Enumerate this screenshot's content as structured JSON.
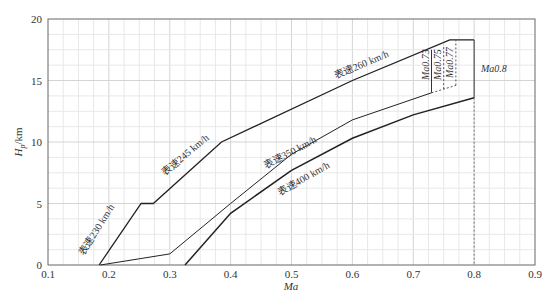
{
  "chart_data": {
    "type": "line",
    "title": "",
    "xlabel": "Ma",
    "ylabel": "H_p/km",
    "xlim": [
      0.1,
      0.9
    ],
    "ylim": [
      0,
      20
    ],
    "x_ticks": [
      "0.1",
      "0.2",
      "0.3",
      "0.4",
      "0.5",
      "0.6",
      "0.7",
      "0.8",
      "0.9"
    ],
    "y_ticks": [
      "0",
      "5",
      "10",
      "15",
      "20"
    ],
    "grid": true,
    "legend": "none (inline labels)",
    "series": [
      {
        "name": "upper envelope (表速230 / 245 / 260 km/h)",
        "points": [
          [
            0.184,
            0
          ],
          [
            0.253,
            5.0
          ],
          [
            0.273,
            5.0
          ],
          [
            0.385,
            10.0
          ],
          [
            0.6,
            15.0
          ],
          [
            0.76,
            18.3
          ],
          [
            0.8,
            18.3
          ]
        ]
      },
      {
        "name": "表速350 km/h",
        "points": [
          [
            0.186,
            0
          ],
          [
            0.3,
            0.9
          ],
          [
            0.4,
            5.0
          ],
          [
            0.5,
            9.0
          ],
          [
            0.6,
            11.8
          ],
          [
            0.73,
            14.0
          ]
        ]
      },
      {
        "name": "表速400 km/h",
        "points": [
          [
            0.325,
            0
          ],
          [
            0.4,
            4.2
          ],
          [
            0.5,
            7.7
          ],
          [
            0.6,
            10.3
          ],
          [
            0.7,
            12.2
          ],
          [
            0.8,
            13.6
          ]
        ]
      }
    ],
    "mach_limits": [
      {
        "label": "Ma0.73",
        "x": 0.73,
        "y_from": 14.0,
        "y_to": 17.5,
        "style": "solid"
      },
      {
        "label": "Ma0.75",
        "x": 0.75,
        "y_from": 14.3,
        "y_to": 17.9,
        "style": "dashed"
      },
      {
        "label": "Ma0.77",
        "x": 0.77,
        "y_from": 14.6,
        "y_to": 18.3,
        "style": "dashed"
      },
      {
        "label": "Ma0.8",
        "x": 0.8,
        "y_from": 13.6,
        "y_to": 18.3,
        "style": "solid"
      }
    ],
    "annotations": [
      "表速230 km/h",
      "表速245 km/h",
      "表速260 km/h",
      "表速350 km/h",
      "表速400 km/h",
      "Ma0.73",
      "Ma0.75",
      "Ma0.77",
      "Ma0.8"
    ]
  },
  "labels": {
    "s230": "表速230 km/h",
    "s245": "表速245 km/h",
    "s260": "表速260 km/h",
    "s350": "表速350 km/h",
    "s400": "表速400 km/h",
    "m073": "Ma0.73",
    "m075": "Ma0.75",
    "m077": "Ma0.77",
    "m08": "Ma0.8",
    "xlabel": "Ma",
    "ylabel_main": "H",
    "ylabel_sub": "p",
    "ylabel_unit": "/km"
  }
}
